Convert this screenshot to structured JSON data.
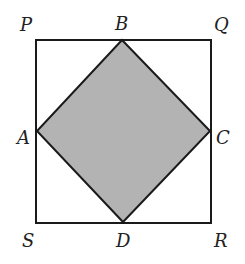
{
  "figure": {
    "outer_square": {
      "label": "PQRS",
      "vertices": {
        "P": {
          "label": "P"
        },
        "Q": {
          "label": "Q"
        },
        "R": {
          "label": "R"
        },
        "S": {
          "label": "S"
        }
      }
    },
    "inner_square": {
      "label": "ABCD",
      "shaded": true,
      "fill_color": "#b3b3b3",
      "vertices": {
        "A": {
          "label": "A"
        },
        "B": {
          "label": "B"
        },
        "C": {
          "label": "C"
        },
        "D": {
          "label": "D"
        }
      }
    },
    "stroke_color": "#1a1a1a"
  }
}
